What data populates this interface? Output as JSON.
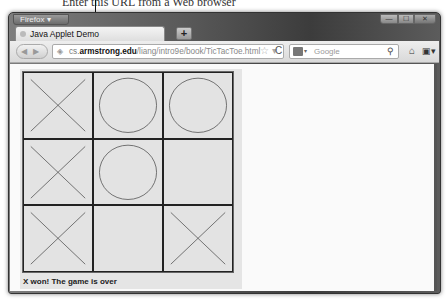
{
  "caption": {
    "text": "Enter this URL from a Web browser"
  },
  "window": {
    "app_button": "Firefox ▾",
    "controls": {
      "minimize": "—",
      "maximize": "☐",
      "close": "✕"
    }
  },
  "tabs": [
    {
      "title": "Java Applet Demo",
      "active": true
    }
  ],
  "new_tab_label": "+",
  "navbar": {
    "back_forward": "◀ ▶",
    "url": {
      "prefix": "cs.",
      "host": "armstrong.edu",
      "path": "/liang/intro9e/book/TicTacToe.html"
    },
    "star": "☆ ▾",
    "reload": "C",
    "search_placeholder": "Google",
    "search_engine_drop": "▾",
    "search_icon": "⚲",
    "home_icon": "⌂",
    "bookmarks_icon": "▣▾"
  },
  "game": {
    "board": [
      [
        "X",
        "O",
        "O"
      ],
      [
        "X",
        "O",
        ""
      ],
      [
        "X",
        "",
        "X"
      ]
    ],
    "status": "X won! The game is over",
    "colors": {
      "line": "#222222",
      "mark": "#555555",
      "cell": "#e3e3e3"
    }
  }
}
